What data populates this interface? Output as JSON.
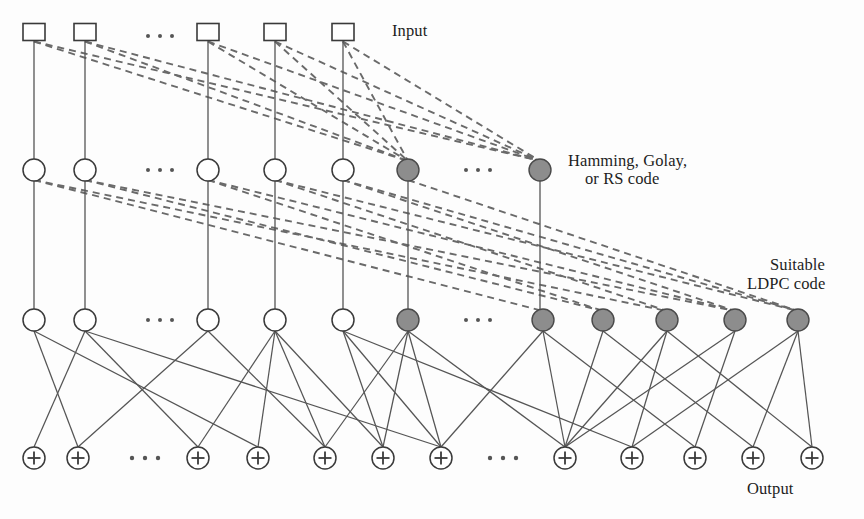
{
  "figure": {
    "type": "diagram",
    "subtype": "tanner-graph-concatenated-code",
    "background_color": "#fdfdfd",
    "line_color": "#555555",
    "dashed_line_color": "#6a6a6a",
    "filled_node_color": "#8d8d8d",
    "open_node_color": "#ffffff",
    "stroke_color": "#3a3a3a"
  },
  "labels": [
    {
      "id": "input",
      "text": "Input",
      "x": 392,
      "y": 36,
      "anchor": "start"
    },
    {
      "id": "code1a",
      "text": "Hamming, Golay,",
      "x": 568,
      "y": 166,
      "anchor": "start"
    },
    {
      "id": "code1b",
      "text": "or RS code",
      "x": 585,
      "y": 184,
      "anchor": "start"
    },
    {
      "id": "code2a",
      "text": "Suitable",
      "x": 770,
      "y": 270,
      "anchor": "start"
    },
    {
      "id": "code2b",
      "text": "LDPC code",
      "x": 747,
      "y": 289,
      "anchor": "start"
    },
    {
      "id": "output",
      "text": "Output",
      "x": 747,
      "y": 494,
      "anchor": "start"
    }
  ],
  "rows": {
    "input_squares": {
      "name": "input-layer",
      "y": 32,
      "width": 22,
      "height": 17,
      "nodes": [
        {
          "x": 34,
          "fill": "open"
        },
        {
          "x": 85,
          "fill": "open"
        },
        {
          "x": 208,
          "fill": "open"
        },
        {
          "x": 275,
          "fill": "open"
        },
        {
          "x": 343,
          "fill": "open"
        }
      ]
    },
    "hidden_circles": {
      "name": "hamming-golay-rs-layer",
      "y": 170,
      "radius": 11,
      "nodes": [
        {
          "x": 34,
          "fill": "open"
        },
        {
          "x": 85,
          "fill": "open"
        },
        {
          "x": 208,
          "fill": "open"
        },
        {
          "x": 275,
          "fill": "open"
        },
        {
          "x": 343,
          "fill": "open"
        },
        {
          "x": 408,
          "fill": "filled"
        },
        {
          "x": 540,
          "fill": "filled"
        }
      ]
    },
    "variable_circles": {
      "name": "ldpc-variable-layer",
      "y": 320,
      "radius": 11,
      "nodes": [
        {
          "x": 34,
          "fill": "open"
        },
        {
          "x": 85,
          "fill": "open"
        },
        {
          "x": 208,
          "fill": "open"
        },
        {
          "x": 275,
          "fill": "open"
        },
        {
          "x": 343,
          "fill": "open"
        },
        {
          "x": 408,
          "fill": "filled"
        },
        {
          "x": 543,
          "fill": "filled"
        },
        {
          "x": 603,
          "fill": "filled"
        },
        {
          "x": 667,
          "fill": "filled"
        },
        {
          "x": 735,
          "fill": "filled"
        },
        {
          "x": 798,
          "fill": "filled"
        }
      ]
    },
    "check_nodes": {
      "name": "output-check-layer",
      "y": 458,
      "radius": 11,
      "nodes": [
        {
          "x": 34
        },
        {
          "x": 78
        },
        {
          "x": 198
        },
        {
          "x": 258
        },
        {
          "x": 325
        },
        {
          "x": 383
        },
        {
          "x": 441
        },
        {
          "x": 565
        },
        {
          "x": 632
        },
        {
          "x": 695
        },
        {
          "x": 753
        },
        {
          "x": 812
        }
      ]
    }
  },
  "ellipses": [
    {
      "id": "ellipsis-input",
      "x": 148,
      "y": 36,
      "count": 3,
      "spacing": 12,
      "radius": 2.0
    },
    {
      "id": "ellipsis-hidden",
      "x": 148,
      "y": 170,
      "count": 3,
      "spacing": 12,
      "radius": 2.0
    },
    {
      "id": "ellipsis-hidden-r",
      "x": 466,
      "y": 170,
      "count": 3,
      "spacing": 12,
      "radius": 2.0
    },
    {
      "id": "ellipsis-var",
      "x": 148,
      "y": 320,
      "count": 3,
      "spacing": 12,
      "radius": 2.0
    },
    {
      "id": "ellipsis-var-r",
      "x": 466,
      "y": 320,
      "count": 3,
      "spacing": 12,
      "radius": 2.0
    },
    {
      "id": "ellipsis-check",
      "x": 132,
      "y": 458,
      "count": 3,
      "spacing": 13,
      "radius": 2.2
    },
    {
      "id": "ellipsis-check-r",
      "x": 490,
      "y": 458,
      "count": 3,
      "spacing": 13,
      "radius": 2.2
    }
  ],
  "edges": {
    "vertical_square_to_hidden": [
      {
        "x": 34
      },
      {
        "x": 85
      },
      {
        "x": 208
      },
      {
        "x": 275
      },
      {
        "x": 343
      }
    ],
    "vertical_hidden_to_variable": [
      {
        "x": 34
      },
      {
        "x": 85
      },
      {
        "x": 208
      },
      {
        "x": 275
      },
      {
        "x": 343
      },
      {
        "x": 408
      },
      {
        "x": 540
      }
    ],
    "dashed_square_to_hidden": [
      {
        "from_x": 34,
        "to_x": 408
      },
      {
        "from_x": 34,
        "to_x": 540
      },
      {
        "from_x": 85,
        "to_x": 408
      },
      {
        "from_x": 85,
        "to_x": 540
      },
      {
        "from_x": 208,
        "to_x": 408
      },
      {
        "from_x": 208,
        "to_x": 540
      },
      {
        "from_x": 275,
        "to_x": 408
      },
      {
        "from_x": 275,
        "to_x": 540
      },
      {
        "from_x": 343,
        "to_x": 408
      },
      {
        "from_x": 343,
        "to_x": 540
      }
    ],
    "dashed_hidden_to_variable": [
      {
        "from_x": 34,
        "to_x": 543
      },
      {
        "from_x": 34,
        "to_x": 667
      },
      {
        "from_x": 85,
        "to_x": 603
      },
      {
        "from_x": 85,
        "to_x": 735
      },
      {
        "from_x": 208,
        "to_x": 603
      },
      {
        "from_x": 208,
        "to_x": 735
      },
      {
        "from_x": 275,
        "to_x": 667
      },
      {
        "from_x": 275,
        "to_x": 798
      },
      {
        "from_x": 343,
        "to_x": 735
      },
      {
        "from_x": 343,
        "to_x": 798
      },
      {
        "from_x": 408,
        "to_x": 798
      }
    ],
    "solid_variable_to_check": [
      {
        "from_x": 34,
        "to_x": 78
      },
      {
        "from_x": 34,
        "to_x": 258
      },
      {
        "from_x": 85,
        "to_x": 34
      },
      {
        "from_x": 85,
        "to_x": 441
      },
      {
        "from_x": 208,
        "to_x": 78
      },
      {
        "from_x": 208,
        "to_x": 325
      },
      {
        "from_x": 275,
        "to_x": 198
      },
      {
        "from_x": 275,
        "to_x": 258
      },
      {
        "from_x": 275,
        "to_x": 325
      },
      {
        "from_x": 275,
        "to_x": 383
      },
      {
        "from_x": 343,
        "to_x": 383
      },
      {
        "from_x": 343,
        "to_x": 632
      },
      {
        "from_x": 408,
        "to_x": 325
      },
      {
        "from_x": 408,
        "to_x": 383
      },
      {
        "from_x": 408,
        "to_x": 565
      },
      {
        "from_x": 543,
        "to_x": 441
      },
      {
        "from_x": 543,
        "to_x": 565
      },
      {
        "from_x": 543,
        "to_x": 695
      },
      {
        "from_x": 603,
        "to_x": 565
      },
      {
        "from_x": 603,
        "to_x": 753
      },
      {
        "from_x": 667,
        "to_x": 565
      },
      {
        "from_x": 667,
        "to_x": 632
      },
      {
        "from_x": 667,
        "to_x": 812
      },
      {
        "from_x": 735,
        "to_x": 565
      },
      {
        "from_x": 735,
        "to_x": 695
      },
      {
        "from_x": 798,
        "to_x": 632
      },
      {
        "from_x": 798,
        "to_x": 753
      },
      {
        "from_x": 798,
        "to_x": 812
      },
      {
        "from_x": 85,
        "to_x": 198
      },
      {
        "from_x": 343,
        "to_x": 441
      },
      {
        "from_x": 408,
        "to_x": 441
      }
    ]
  }
}
